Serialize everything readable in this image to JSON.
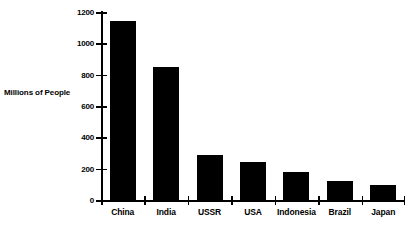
{
  "chart_data": {
    "type": "bar",
    "title": "",
    "subtitle": "",
    "xlabel": "",
    "ylabel": "Millions of People",
    "categories": [
      "China",
      "India",
      "USSR",
      "USA",
      "Indonesia",
      "Brazil",
      "Japan"
    ],
    "values": [
      1140,
      850,
      290,
      240,
      180,
      120,
      95
    ],
    "series": [
      {
        "name": "Population",
        "values": [
          1140,
          850,
          290,
          240,
          180,
          120,
          95
        ]
      }
    ],
    "ylim": [
      0,
      1200
    ],
    "y_ticks": [
      0,
      200,
      400,
      600,
      800,
      1000,
      1200
    ],
    "y_tick_labels": [
      "0",
      "200",
      "400",
      "600",
      "800",
      "1000",
      "1200"
    ],
    "grid": false,
    "legend": false,
    "legend_position": "none",
    "bar_color": "#000000",
    "axis_color": "#000000",
    "background_color": "#ffffff",
    "annotations": []
  },
  "axis": {
    "y_title": "Millions of People"
  }
}
